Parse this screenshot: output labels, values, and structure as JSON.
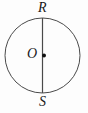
{
  "diagram": {
    "type": "circle-with-diameter",
    "labels": {
      "top_point": "R",
      "center_point": "O",
      "bottom_point": "S"
    },
    "geometry": {
      "circle_center_x": 42.5,
      "circle_center_y": 55.5,
      "circle_radius": 37.5,
      "diameter_from": "R (top)",
      "diameter_to": "S (bottom)",
      "center_dot_radius": 2
    },
    "colors": {
      "stroke": "#4a4a4a",
      "dot_fill": "#111111",
      "label_text": "#1a1a1a",
      "background": "#fdfdfd"
    }
  }
}
